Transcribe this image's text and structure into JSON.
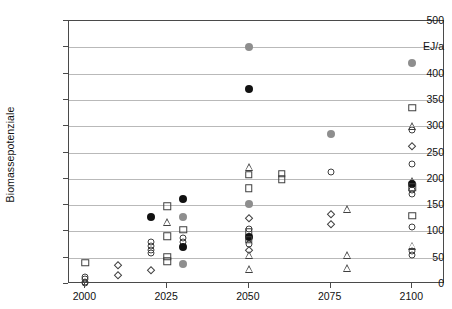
{
  "chart": {
    "title": "",
    "ylabel": "Biomassepotenziale",
    "unit_label": "EJ/a",
    "xlabel": ""
  },
  "chart_data": {
    "type": "scatter",
    "title": "",
    "xlabel": "",
    "ylabel": "Biomassepotenziale",
    "unit_annotation": "EJ/a",
    "grid": true,
    "legend": "none",
    "xlim": [
      1995,
      2110
    ],
    "ylim": [
      0,
      500
    ],
    "x_ticks": [
      2000,
      2025,
      2050,
      2075,
      2100
    ],
    "x_tick_labels": [
      "2000",
      "2025",
      "2050",
      "2075",
      "2100"
    ],
    "y_ticks": [
      0,
      50,
      100,
      150,
      200,
      250,
      300,
      350,
      400,
      450,
      500
    ],
    "y_tick_labels": [
      "0",
      "50",
      "100",
      "150",
      "200",
      "250",
      "300",
      "350",
      "400",
      "EJ/a",
      "500"
    ],
    "marker_styles": {
      "circle-open": "open circle",
      "circle-filled-black": "filled black circle",
      "circle-filled-gray": "filled gray circle",
      "square-open": "open square",
      "diamond-open": "open diamond",
      "triangle-open": "open triangle"
    },
    "points": [
      {
        "x": 2000,
        "y": 40,
        "marker": "square-open"
      },
      {
        "x": 2000,
        "y": 14,
        "marker": "circle-open"
      },
      {
        "x": 2000,
        "y": 9,
        "marker": "circle-open"
      },
      {
        "x": 2000,
        "y": 4,
        "marker": "circle-open"
      },
      {
        "x": 2000,
        "y": 1,
        "marker": "circle-open"
      },
      {
        "x": 2010,
        "y": 37,
        "marker": "diamond-open"
      },
      {
        "x": 2010,
        "y": 17,
        "marker": "diamond-open"
      },
      {
        "x": 2020,
        "y": 127,
        "marker": "circle-filled-black"
      },
      {
        "x": 2020,
        "y": 80,
        "marker": "circle-open"
      },
      {
        "x": 2020,
        "y": 72,
        "marker": "circle-open"
      },
      {
        "x": 2020,
        "y": 65,
        "marker": "circle-open"
      },
      {
        "x": 2020,
        "y": 58,
        "marker": "circle-open"
      },
      {
        "x": 2020,
        "y": 27,
        "marker": "diamond-open"
      },
      {
        "x": 2025,
        "y": 148,
        "marker": "square-open"
      },
      {
        "x": 2025,
        "y": 118,
        "marker": "triangle-open"
      },
      {
        "x": 2025,
        "y": 91,
        "marker": "square-open"
      },
      {
        "x": 2025,
        "y": 52,
        "marker": "square-open"
      },
      {
        "x": 2025,
        "y": 43,
        "marker": "square-open"
      },
      {
        "x": 2030,
        "y": 162,
        "marker": "circle-filled-black"
      },
      {
        "x": 2030,
        "y": 127,
        "marker": "circle-filled-gray"
      },
      {
        "x": 2030,
        "y": 103,
        "marker": "square-open"
      },
      {
        "x": 2030,
        "y": 88,
        "marker": "circle-open"
      },
      {
        "x": 2030,
        "y": 79,
        "marker": "circle-open"
      },
      {
        "x": 2030,
        "y": 71,
        "marker": "circle-filled-black"
      },
      {
        "x": 2030,
        "y": 38,
        "marker": "circle-filled-gray"
      },
      {
        "x": 2050,
        "y": 450,
        "marker": "circle-filled-gray"
      },
      {
        "x": 2050,
        "y": 370,
        "marker": "circle-filled-black"
      },
      {
        "x": 2050,
        "y": 222,
        "marker": "triangle-open"
      },
      {
        "x": 2050,
        "y": 208,
        "marker": "square-open"
      },
      {
        "x": 2050,
        "y": 182,
        "marker": "square-open"
      },
      {
        "x": 2050,
        "y": 152,
        "marker": "circle-filled-gray"
      },
      {
        "x": 2050,
        "y": 126,
        "marker": "diamond-open"
      },
      {
        "x": 2050,
        "y": 104,
        "marker": "circle-open"
      },
      {
        "x": 2050,
        "y": 99,
        "marker": "square-open"
      },
      {
        "x": 2050,
        "y": 90,
        "marker": "circle-filled-black"
      },
      {
        "x": 2050,
        "y": 84,
        "marker": "square-open"
      },
      {
        "x": 2050,
        "y": 76,
        "marker": "circle-open"
      },
      {
        "x": 2050,
        "y": 64,
        "marker": "diamond-open"
      },
      {
        "x": 2050,
        "y": 55,
        "marker": "triangle-open"
      },
      {
        "x": 2050,
        "y": 28,
        "marker": "triangle-open"
      },
      {
        "x": 2060,
        "y": 210,
        "marker": "square-open"
      },
      {
        "x": 2060,
        "y": 199,
        "marker": "square-open"
      },
      {
        "x": 2075,
        "y": 212,
        "marker": "circle-open"
      },
      {
        "x": 2075,
        "y": 285,
        "marker": "circle-filled-gray"
      },
      {
        "x": 2075,
        "y": 134,
        "marker": "diamond-open"
      },
      {
        "x": 2075,
        "y": 115,
        "marker": "diamond-open"
      },
      {
        "x": 2080,
        "y": 143,
        "marker": "triangle-open"
      },
      {
        "x": 2080,
        "y": 55,
        "marker": "triangle-open"
      },
      {
        "x": 2080,
        "y": 30,
        "marker": "triangle-open"
      },
      {
        "x": 2100,
        "y": 420,
        "marker": "circle-filled-gray"
      },
      {
        "x": 2100,
        "y": 335,
        "marker": "square-open"
      },
      {
        "x": 2100,
        "y": 300,
        "marker": "triangle-open"
      },
      {
        "x": 2100,
        "y": 293,
        "marker": "circle-open"
      },
      {
        "x": 2100,
        "y": 262,
        "marker": "diamond-open"
      },
      {
        "x": 2100,
        "y": 228,
        "marker": "circle-open"
      },
      {
        "x": 2100,
        "y": 196,
        "marker": "triangle-open"
      },
      {
        "x": 2100,
        "y": 190,
        "marker": "circle-filled-black"
      },
      {
        "x": 2100,
        "y": 184,
        "marker": "square-open"
      },
      {
        "x": 2100,
        "y": 178,
        "marker": "circle-open"
      },
      {
        "x": 2100,
        "y": 172,
        "marker": "circle-open"
      },
      {
        "x": 2100,
        "y": 130,
        "marker": "square-open"
      },
      {
        "x": 2100,
        "y": 108,
        "marker": "circle-open"
      },
      {
        "x": 2100,
        "y": 73,
        "marker": "triangle-open"
      },
      {
        "x": 2100,
        "y": 63,
        "marker": "circle-open"
      },
      {
        "x": 2100,
        "y": 55,
        "marker": "circle-open"
      }
    ]
  }
}
